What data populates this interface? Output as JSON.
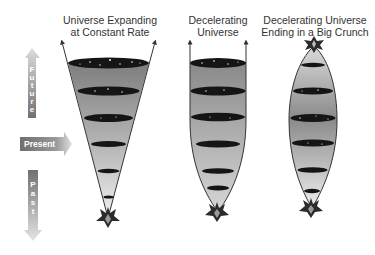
{
  "diagram": {
    "timeline": {
      "future_label": "Future",
      "future_letters": [
        "F",
        "u",
        "t",
        "u",
        "r",
        "e"
      ],
      "present_label": "Present",
      "past_label": "Past",
      "past_letters": [
        "P",
        "a",
        "s",
        "t"
      ]
    },
    "models": [
      {
        "id": "constant",
        "title_line1": "Universe Expanding",
        "title_line2": "at Constant Rate",
        "shape": "straight cone with diverging arrows"
      },
      {
        "id": "decelerating",
        "title_line1": "Decelerating",
        "title_line2": "Universe",
        "shape": "curved cone flattening to parallel arrows"
      },
      {
        "id": "big-crunch",
        "title_line1": "Decelerating Universe",
        "title_line2": "Ending in a Big Crunch",
        "shape": "spindle closing to a point at top"
      }
    ],
    "colors": {
      "arrow_dark": "#7a7a7a",
      "arrow_light": "#d8d8d8",
      "cone_dark": "#808080",
      "cone_light": "#eeeeee",
      "ellipse": "#1a1a1a",
      "outline": "#333333",
      "text": "#333333"
    }
  }
}
